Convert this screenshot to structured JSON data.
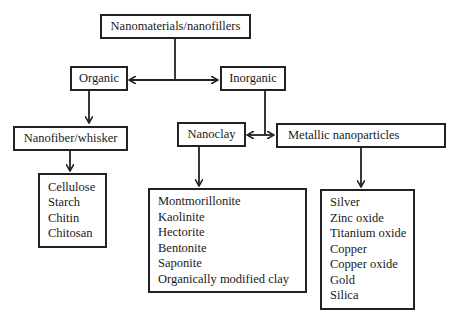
{
  "diagram": {
    "root": {
      "label": "Nanomaterials/nanofillers"
    },
    "organic": {
      "label": "Organic"
    },
    "inorganic": {
      "label": "Inorganic"
    },
    "nanofiber": {
      "label": "Nanofiber/whisker"
    },
    "nanoclay": {
      "label": "Nanoclay"
    },
    "metallic": {
      "label": "Metallic nanoparticles"
    },
    "organic_list": {
      "items": [
        "Cellulose",
        "Starch",
        "Chitin",
        "Chitosan"
      ]
    },
    "clay_list": {
      "items": [
        "Montmorillonite",
        "Kaolinite",
        "Hectorite",
        "Bentonite",
        "Saponite",
        "Organically modified clay"
      ]
    },
    "metal_list": {
      "items": [
        "Silver",
        "Zinc oxide",
        "Titanium oxide",
        "Copper",
        "Copper oxide",
        "Gold",
        "Silica"
      ]
    }
  },
  "colors": {
    "line": "#222222",
    "background": "#ffffff"
  }
}
